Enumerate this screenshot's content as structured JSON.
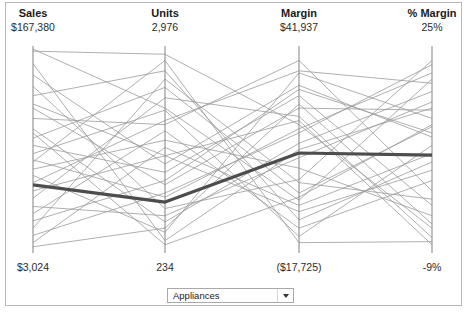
{
  "chart_data": {
    "type": "line",
    "chart_subtype": "parallel-coordinates",
    "title": "",
    "axes": [
      {
        "name": "Sales",
        "max_label": "$167,380",
        "min_label": "$3,024",
        "max_value": 167380,
        "min_value": 3024,
        "x": 33
      },
      {
        "name": "Units",
        "max_label": "2,976",
        "min_label": "234",
        "max_value": 2976,
        "min_value": 234,
        "x": 165
      },
      {
        "name": "Margin",
        "max_label": "$41,937",
        "min_label": "($17,725)",
        "max_value": 41937,
        "min_value": -17725,
        "x": 299
      },
      {
        "name": "% Margin",
        "max_label": "25%",
        "min_label": "-9%",
        "max_value": 25,
        "min_value": -9,
        "x": 432
      }
    ],
    "axis_top_y": 46,
    "axis_bottom_y": 253,
    "grid": false,
    "legend": "none",
    "series": [
      {
        "name": "highlighted",
        "highlighted": true,
        "color": "#4d4d4d",
        "values": [
          0.329,
          0.246,
          0.483,
          0.473
        ]
      },
      {
        "name": "line-01",
        "highlighted": false,
        "values": [
          0.985,
          0.7,
          0.255,
          0.84
        ]
      },
      {
        "name": "line-02",
        "highlighted": false,
        "values": [
          0.975,
          0.96,
          0.62,
          0.12
        ]
      },
      {
        "name": "line-03",
        "highlighted": false,
        "values": [
          0.86,
          0.43,
          0.81,
          0.56
        ]
      },
      {
        "name": "line-04",
        "highlighted": false,
        "values": [
          0.805,
          0.215,
          0.355,
          0.93
        ]
      },
      {
        "name": "line-05",
        "highlighted": false,
        "values": [
          0.76,
          0.88,
          0.16,
          0.44
        ]
      },
      {
        "name": "line-06",
        "highlighted": false,
        "values": [
          0.7,
          0.33,
          0.7,
          0.69
        ]
      },
      {
        "name": "line-07",
        "highlighted": false,
        "values": [
          0.65,
          0.62,
          0.93,
          0.3
        ]
      },
      {
        "name": "line-08",
        "highlighted": false,
        "values": [
          0.6,
          0.15,
          0.53,
          0.78
        ]
      },
      {
        "name": "line-09",
        "highlighted": false,
        "values": [
          0.555,
          0.8,
          0.29,
          0.61
        ]
      },
      {
        "name": "line-10",
        "highlighted": false,
        "values": [
          0.52,
          0.39,
          0.76,
          0.23
        ]
      },
      {
        "name": "line-11",
        "highlighted": false,
        "values": [
          0.48,
          0.69,
          0.08,
          0.52
        ]
      },
      {
        "name": "line-12",
        "highlighted": false,
        "values": [
          0.45,
          0.27,
          0.6,
          0.87
        ]
      },
      {
        "name": "line-13",
        "highlighted": false,
        "values": [
          0.405,
          0.545,
          0.41,
          0.18
        ]
      },
      {
        "name": "line-14",
        "highlighted": false,
        "values": [
          0.375,
          0.1,
          0.87,
          0.65
        ]
      },
      {
        "name": "line-15",
        "highlighted": false,
        "values": [
          0.3,
          0.47,
          0.2,
          0.4
        ]
      },
      {
        "name": "line-16",
        "highlighted": false,
        "values": [
          0.265,
          0.75,
          0.66,
          0.075
        ]
      },
      {
        "name": "line-17",
        "highlighted": false,
        "values": [
          0.225,
          0.18,
          0.46,
          0.73
        ]
      },
      {
        "name": "line-18",
        "highlighted": false,
        "values": [
          0.19,
          0.59,
          0.12,
          0.35
        ]
      },
      {
        "name": "line-19",
        "highlighted": false,
        "values": [
          0.155,
          0.35,
          0.79,
          0.58
        ]
      },
      {
        "name": "line-20",
        "highlighted": false,
        "values": [
          0.12,
          0.84,
          0.34,
          0.26
        ]
      },
      {
        "name": "line-21",
        "highlighted": false,
        "values": [
          0.085,
          0.29,
          0.58,
          0.91
        ]
      },
      {
        "name": "line-22",
        "highlighted": false,
        "values": [
          0.05,
          0.51,
          0.23,
          0.48
        ]
      },
      {
        "name": "line-23",
        "highlighted": false,
        "values": [
          0.03,
          0.12,
          0.72,
          0.14
        ]
      },
      {
        "name": "line-24",
        "highlighted": false,
        "values": [
          0.915,
          0.06,
          0.5,
          0.7
        ]
      },
      {
        "name": "line-25",
        "highlighted": false,
        "values": [
          0.44,
          0.93,
          0.05,
          0.055
        ]
      },
      {
        "name": "line-26",
        "highlighted": false,
        "values": [
          0.34,
          0.64,
          0.88,
          0.82
        ]
      },
      {
        "name": "line-27",
        "highlighted": false,
        "values": [
          0.58,
          0.04,
          0.27,
          0.62
        ]
      },
      {
        "name": "line-28",
        "highlighted": false,
        "values": [
          0.72,
          0.47,
          0.64,
          0.04
        ]
      }
    ],
    "line_color": "#9a9a9a",
    "highlight_color": "#4d4d4d",
    "axis_color": "#8c8c8c"
  },
  "header": {
    "columns": [
      {
        "title": "Sales",
        "value": "$167,380"
      },
      {
        "title": "Units",
        "value": "2,976"
      },
      {
        "title": "Margin",
        "value": "$41,937"
      },
      {
        "title": "% Margin",
        "value": "25%"
      }
    ]
  },
  "footer": {
    "columns": [
      {
        "value": "$3,024"
      },
      {
        "value": "234"
      },
      {
        "value": "($17,725)"
      },
      {
        "value": "-9%"
      }
    ]
  },
  "controls": {
    "category_filter": {
      "selected": "Appliances",
      "icon": "chevron-down-icon"
    }
  }
}
